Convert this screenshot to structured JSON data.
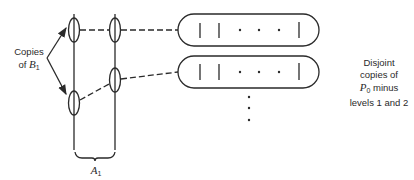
{
  "diagram": {
    "labels": {
      "copies_line1": "Copies",
      "copies_line2_prefix": "of ",
      "copies_symbol": "B",
      "copies_subscript": "1",
      "disjoint_line1": "Disjoint",
      "disjoint_line2": "copies of",
      "disjoint_symbol": "P",
      "disjoint_subscript": "0",
      "disjoint_line3_suffix": " minus",
      "disjoint_line4": "levels 1 and 2",
      "a_symbol": "A",
      "a_subscript": "1"
    },
    "nodes": [
      {
        "id": "left-top",
        "cx": 74,
        "cy": 30
      },
      {
        "id": "left-bottom",
        "cx": 74,
        "cy": 103
      },
      {
        "id": "right-top",
        "cx": 115,
        "cy": 30
      },
      {
        "id": "right-middle",
        "cx": 115,
        "cy": 80
      }
    ],
    "capsules": [
      {
        "id": "capsule-1",
        "y": 14
      },
      {
        "id": "capsule-2",
        "y": 56
      }
    ],
    "stroke_color": "#2a2a2a"
  }
}
